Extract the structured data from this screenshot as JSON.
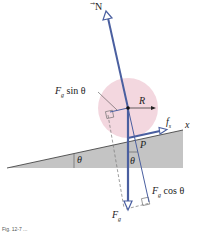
{
  "figure": {
    "labels": {
      "normal_force": "N",
      "fg_sin": "F",
      "fg_sin_sub": "g",
      "fg_sin_rest": " sin θ",
      "radius": "R",
      "friction": "f",
      "friction_sub": "s",
      "x_axis": "x",
      "contact_point": "P",
      "angle_incline": "θ",
      "angle_vertical": "θ",
      "fg_cos": "F",
      "fg_cos_sub": "g",
      "fg_cos_rest": " cos θ",
      "gravity": "F",
      "gravity_sub": "g"
    },
    "colors": {
      "vector": "#4a5fa0",
      "ball": "#f2d3dc",
      "incline": "#c4c4c4",
      "dashed": "#777777"
    },
    "caption": "Fig. 12-7  ..."
  }
}
